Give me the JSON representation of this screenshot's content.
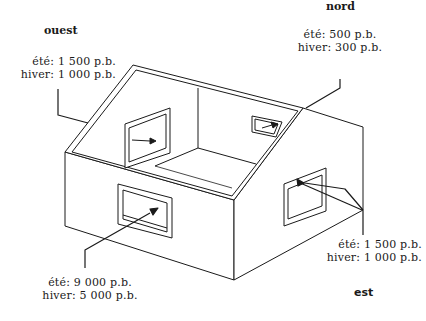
{
  "diagram": {
    "type": "isometric house heat-gain diagram",
    "directions": {
      "ouest": "ouest",
      "nord": "nord",
      "est": "est"
    },
    "labels": {
      "ouest": {
        "summer": "été: 1 500 p.b.",
        "winter": "hiver: 1 000 p.b."
      },
      "nord": {
        "summer": "été: 500 p.b.",
        "winter": "hiver: 300 p.b."
      },
      "est": {
        "summer": "été: 1 500 p.b.",
        "winter": "hiver: 1 000 p.b."
      },
      "sud": {
        "summer": "été: 9 000 p.b.",
        "winter": "hiver: 5 000 p.b."
      }
    },
    "colors": {
      "line": "#1a1a1a",
      "background": "#ffffff"
    }
  }
}
